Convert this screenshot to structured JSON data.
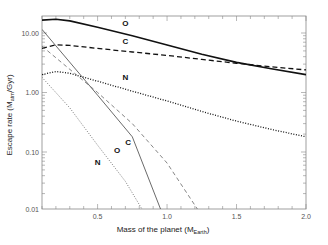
{
  "chart_data": {
    "type": "line",
    "title": "",
    "xlabel": "Mass of the planet (M",
    "xlabel_sub": "Earth",
    "xlabel_end": ")",
    "ylabel": "Escape rate (M",
    "ylabel_sub": "atm",
    "ylabel_end": "/Gyr)",
    "xlim": [
      0.1,
      2.0
    ],
    "ylim": [
      0.01,
      20
    ],
    "yscale": "log",
    "x_ticks": [
      "0.5",
      "1.0",
      "1.5",
      "2.0"
    ],
    "x_tick_values": [
      0.5,
      1.0,
      1.5,
      2.0
    ],
    "y_ticks": [
      "10.00",
      "1.00",
      "0.10",
      "0.01"
    ],
    "y_tick_values": [
      10,
      1,
      0.1,
      0.01
    ],
    "grid": false,
    "series": [
      {
        "name": "O (thick solid)",
        "label": "O",
        "style": "solid",
        "width": 1.6,
        "color": "#111111",
        "x": [
          0.1,
          0.2,
          0.3,
          0.5,
          0.75,
          1.0,
          1.25,
          1.5,
          1.75,
          2.0
        ],
        "values": [
          16.5,
          17.0,
          16.0,
          12.5,
          9.0,
          6.3,
          4.4,
          3.2,
          2.5,
          2.0
        ]
      },
      {
        "name": "C (thick dashed)",
        "label": "C",
        "style": "dashed",
        "width": 1.3,
        "color": "#111111",
        "x": [
          0.1,
          0.2,
          0.3,
          0.5,
          0.75,
          1.0,
          1.25,
          1.5,
          1.75,
          2.0
        ],
        "values": [
          5.5,
          6.3,
          6.2,
          5.5,
          4.8,
          4.2,
          3.6,
          3.1,
          2.7,
          2.4
        ]
      },
      {
        "name": "N (thick dotted)",
        "label": "N",
        "style": "dotted",
        "width": 1.3,
        "color": "#111111",
        "x": [
          0.1,
          0.2,
          0.3,
          0.5,
          0.75,
          1.0,
          1.25,
          1.5,
          1.75,
          2.0
        ],
        "values": [
          2.0,
          2.25,
          2.1,
          1.55,
          1.05,
          0.72,
          0.48,
          0.33,
          0.24,
          0.18
        ]
      },
      {
        "name": "O (thin solid)",
        "label": "O",
        "style": "solid",
        "width": 0.8,
        "color": "#444444",
        "x": [
          0.1,
          0.5,
          0.75,
          0.96
        ],
        "values": [
          11.5,
          0.9,
          0.18,
          0.01
        ]
      },
      {
        "name": "C (thin dashed)",
        "label": "C",
        "style": "dashed",
        "width": 0.8,
        "color": "#666666",
        "x": [
          0.1,
          0.5,
          0.75,
          1.0,
          1.23
        ],
        "values": [
          6.0,
          1.0,
          0.3,
          0.065,
          0.01
        ]
      },
      {
        "name": "N (thin dotted)",
        "label": "N",
        "style": "dotted",
        "width": 0.8,
        "color": "#555555",
        "x": [
          0.1,
          0.3,
          0.5,
          0.7,
          0.83
        ],
        "values": [
          1.8,
          0.55,
          0.13,
          0.032,
          0.01
        ]
      }
    ],
    "annotations": [
      {
        "text": "O",
        "x": 0.7,
        "y": 13
      },
      {
        "text": "C",
        "x": 0.7,
        "y": 6.5
      },
      {
        "text": "N",
        "x": 0.7,
        "y": 1.6
      },
      {
        "text": "C",
        "x": 0.72,
        "y": 0.13
      },
      {
        "text": "O",
        "x": 0.64,
        "y": 0.095
      },
      {
        "text": "N",
        "x": 0.5,
        "y": 0.06
      }
    ]
  }
}
